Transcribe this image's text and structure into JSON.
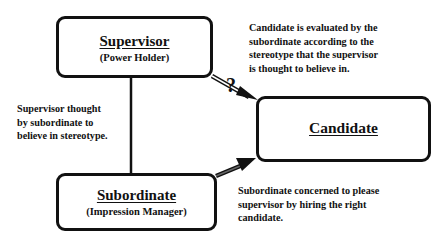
{
  "diagram": {
    "nodes": {
      "supervisor": {
        "title": "Supervisor",
        "subtitle": "(Power Holder)"
      },
      "subordinate": {
        "title": "Subordinate",
        "subtitle": "(Impression Manager)"
      },
      "candidate": {
        "title": "Candidate"
      }
    },
    "edges": [
      {
        "from": "supervisor",
        "to": "subordinate",
        "style": "line",
        "label": "Supervisor thought by subordinate to believe in stereotype."
      },
      {
        "from": "supervisor",
        "to": "candidate",
        "style": "double-line-arrow",
        "marker": "?",
        "label": "Candidate is evaluated by the subordinate according to the stereotype that the supervisor is thought to believe in."
      },
      {
        "from": "subordinate",
        "to": "candidate",
        "style": "double-line-arrow",
        "label": "Subordinate concerned to please supervisor by hiring the right candidate."
      }
    ],
    "notes": {
      "evaluation": [
        "Candidate is evaluated by the",
        "subordinate according to the",
        "stereotype that the supervisor",
        "is thought to believe in."
      ],
      "belief": [
        "Supervisor thought",
        "by subordinate to",
        "believe in stereotype."
      ],
      "concern": [
        "Subordinate concerned to please",
        "supervisor by hiring the right",
        "candidate."
      ]
    },
    "question_mark": "?"
  }
}
